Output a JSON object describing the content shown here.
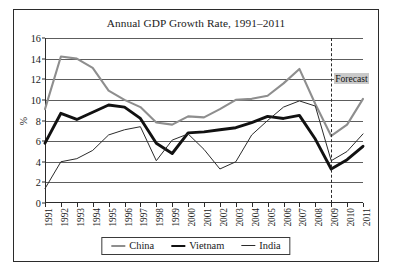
{
  "chart_data": {
    "type": "line",
    "title": "Annual GDP Growth Rate, 1991–2011",
    "xlabel": "",
    "ylabel": "%",
    "ylim": [
      0,
      16
    ],
    "ytick_step": 2,
    "yticks": [
      "0",
      "2",
      "4",
      "6",
      "8",
      "10",
      "12",
      "14",
      "16"
    ],
    "grid": true,
    "legend_position": "bottom",
    "categories": [
      "1991",
      "1992",
      "1993",
      "1994",
      "1995",
      "1996",
      "1997",
      "1998",
      "1999",
      "2000",
      "2001",
      "2002",
      "2003",
      "2004",
      "2005",
      "2006",
      "2007",
      "2008",
      "2009",
      "2010",
      "2011"
    ],
    "series": [
      {
        "name": "China",
        "color": "#8e8e8e",
        "width": 2.1,
        "values": [
          9.1,
          14.2,
          14.0,
          13.1,
          10.9,
          10.0,
          9.3,
          7.8,
          7.6,
          8.4,
          8.3,
          9.1,
          10.0,
          10.1,
          10.4,
          11.6,
          13.0,
          9.6,
          6.5,
          7.6,
          10.1
        ]
      },
      {
        "name": "Vietnam",
        "color": "#111111",
        "width": 2.9,
        "values": [
          5.8,
          8.7,
          8.1,
          8.8,
          9.5,
          9.3,
          8.2,
          5.8,
          4.8,
          6.8,
          6.9,
          7.1,
          7.3,
          7.8,
          8.4,
          8.2,
          8.5,
          6.2,
          3.3,
          4.2,
          5.5
        ]
      },
      {
        "name": "India",
        "color": "#2b2b2b",
        "width": 1.0,
        "values": [
          1.4,
          4.0,
          4.3,
          5.1,
          6.6,
          7.1,
          7.4,
          4.1,
          6.1,
          6.7,
          5.2,
          3.3,
          4.0,
          6.6,
          8.0,
          9.3,
          9.9,
          9.4,
          4.1,
          5.0,
          6.7
        ]
      }
    ],
    "annotations": [
      {
        "name": "forecast-divider",
        "label": "Forecast",
        "at_category": "2009",
        "style": "dashed-vertical"
      }
    ]
  },
  "legend": {
    "entries": [
      {
        "label": "China"
      },
      {
        "label": "Vietnam"
      },
      {
        "label": "India"
      }
    ]
  }
}
